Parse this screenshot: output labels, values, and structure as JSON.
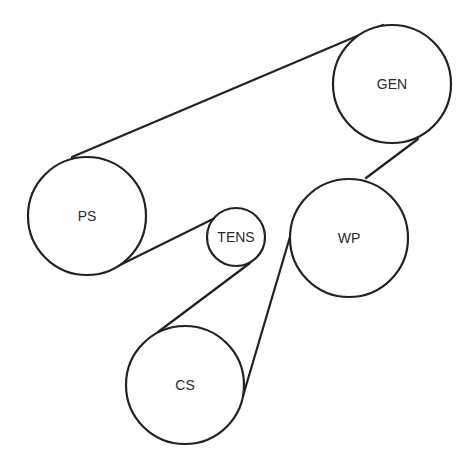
{
  "diagram": {
    "type": "belt-routing",
    "stroke_color": "#222222",
    "background": "#ffffff",
    "pulleys": [
      {
        "id": "gen",
        "label": "GEN",
        "cx": 392,
        "cy": 84,
        "r": 59
      },
      {
        "id": "ps",
        "label": "PS",
        "cx": 87,
        "cy": 216,
        "r": 59
      },
      {
        "id": "tens",
        "label": "TENS",
        "cx": 236,
        "cy": 237,
        "r": 29
      },
      {
        "id": "wp",
        "label": "WP",
        "cx": 349,
        "cy": 238,
        "r": 59
      },
      {
        "id": "cs",
        "label": "CS",
        "cx": 185,
        "cy": 385,
        "r": 59
      }
    ],
    "belt_segments": [
      {
        "from": "ps",
        "to": "gen",
        "x1": 72,
        "y1": 157,
        "x2": 383,
        "y2": 25
      },
      {
        "from": "gen",
        "to": "wp",
        "x1": 418,
        "y1": 139,
        "x2": 366,
        "y2": 178
      },
      {
        "from": "wp",
        "to": "cs",
        "x1": 297,
        "y1": 213,
        "x2": 243,
        "y2": 396
      },
      {
        "from": "cs",
        "to": "tens",
        "x1": 158,
        "y1": 332,
        "x2": 250,
        "y2": 263
      },
      {
        "from": "tens",
        "to": "ps",
        "x1": 213,
        "y1": 219,
        "x2": 118,
        "y2": 266
      }
    ]
  }
}
